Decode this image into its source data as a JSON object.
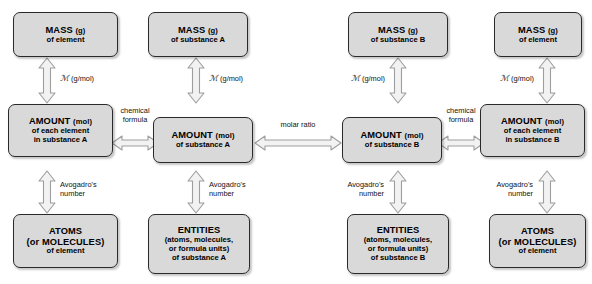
{
  "diagram": {
    "colors": {
      "box_fill": "#d9d9d9",
      "box_border": "#2a2a2a",
      "arrow_fill": "#f2f2f2",
      "arrow_stroke": "#9a9a9a",
      "text": "#000000",
      "background": "#ffffff"
    },
    "boxes": [
      {
        "id": "mass-element-left",
        "column": 1,
        "row": "top",
        "line1": "MASS",
        "unit": "(g)",
        "line2": "of element",
        "line3": "",
        "line4": ""
      },
      {
        "id": "amount-each-element-a",
        "column": 1,
        "row": "middle",
        "line1": "AMOUNT",
        "unit": "(mol)",
        "line2": "of each element",
        "line3": "in substance A",
        "line4": ""
      },
      {
        "id": "atoms-element-left",
        "column": 1,
        "row": "bottom",
        "line1": "ATOMS",
        "unit": "",
        "line2": "(or MOLECULES)",
        "line3": "of element",
        "line4": ""
      },
      {
        "id": "mass-substance-a",
        "column": 2,
        "row": "top",
        "line1": "MASS",
        "unit": "(g)",
        "line2": "of substance A",
        "line3": "",
        "line4": ""
      },
      {
        "id": "amount-substance-a",
        "column": 2,
        "row": "middle",
        "line1": "AMOUNT",
        "unit": "(mol)",
        "line2": "of substance A",
        "line3": "",
        "line4": ""
      },
      {
        "id": "entities-substance-a",
        "column": 2,
        "row": "bottom",
        "line1": "ENTITIES",
        "unit": "",
        "line2": "(atoms, molecules,",
        "line3": "or formula units)",
        "line4": "of substance A"
      },
      {
        "id": "mass-substance-b",
        "column": 3,
        "row": "top",
        "line1": "MASS",
        "unit": "(g)",
        "line2": "of substance B",
        "line3": "",
        "line4": ""
      },
      {
        "id": "amount-substance-b",
        "column": 3,
        "row": "middle",
        "line1": "AMOUNT",
        "unit": "(mol)",
        "line2": "of substance B",
        "line3": "",
        "line4": ""
      },
      {
        "id": "entities-substance-b",
        "column": 3,
        "row": "bottom",
        "line1": "ENTITIES",
        "unit": "",
        "line2": "(atoms, molecules,",
        "line3": "or formula units)",
        "line4": "of substance B"
      },
      {
        "id": "mass-element-right",
        "column": 4,
        "row": "top",
        "line1": "MASS",
        "unit": "(g)",
        "line2": "of element",
        "line3": "",
        "line4": ""
      },
      {
        "id": "amount-each-element-b",
        "column": 4,
        "row": "middle",
        "line1": "AMOUNT",
        "unit": "(mol)",
        "line2": "of each element",
        "line3": "in substance B",
        "line4": ""
      },
      {
        "id": "atoms-element-right",
        "column": 4,
        "row": "bottom",
        "line1": "ATOMS",
        "unit": "",
        "line2": "(or MOLECULES)",
        "line3": "of element",
        "line4": ""
      }
    ],
    "labels": {
      "molar_mass_symbol": "ℳ",
      "molar_mass_units": "(g/mol)",
      "avogadro_line1": "Avogadro's",
      "avogadro_line2": "number",
      "chemical_line1": "chemical",
      "chemical_line2": "formula",
      "molar_ratio": "molar ratio"
    }
  }
}
